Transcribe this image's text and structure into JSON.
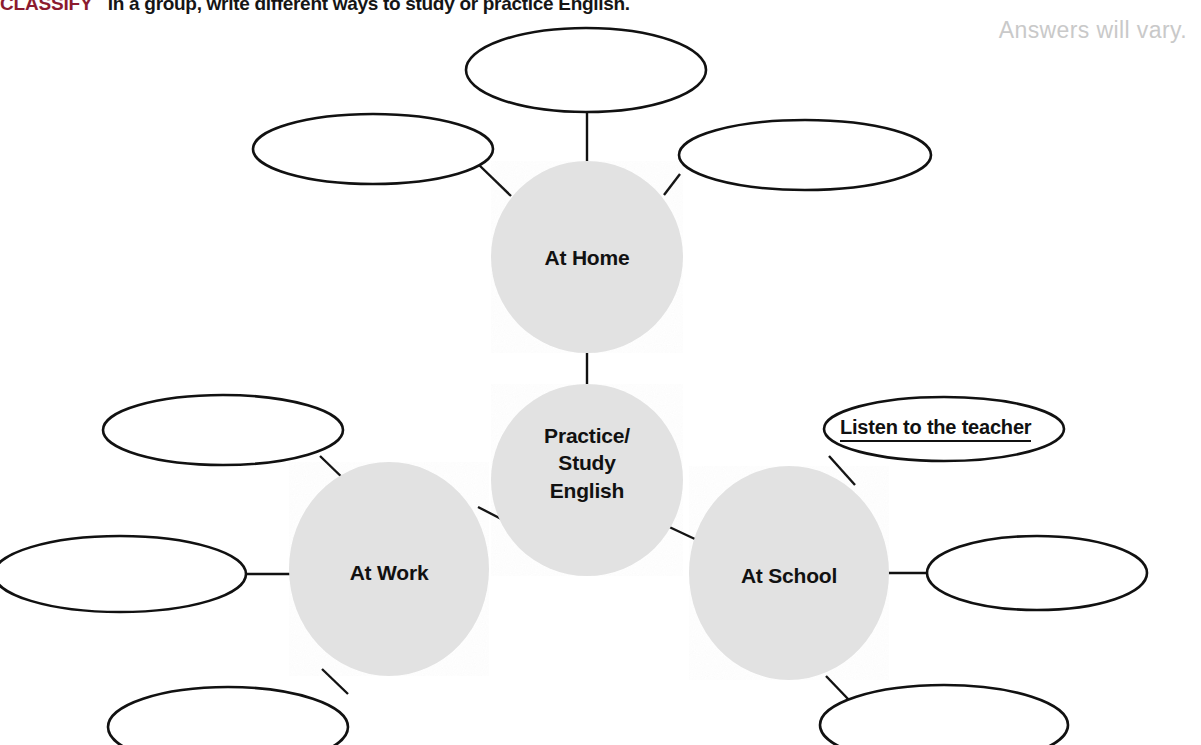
{
  "header": {
    "activity_label": "CLASSIFY",
    "instruction": "In a group, write different ways to study or practice English.",
    "answer_note": "Answers will vary.",
    "label_color": "#8c1b2f"
  },
  "diagram": {
    "type": "cluster-web-organizer",
    "center": {
      "name": "center-node",
      "lines": [
        "Practice/",
        "Study",
        "English"
      ],
      "cx": 587,
      "cy": 480,
      "r": 96,
      "fill": "#e2e2e2"
    },
    "hubs": [
      {
        "name": "hub-at-home",
        "label": "At Home",
        "cx": 587,
        "cy": 257,
        "rx": 96,
        "ry": 96,
        "fill": "#e2e2e2"
      },
      {
        "name": "hub-at-work",
        "label": "At Work",
        "cx": 389,
        "cy": 569,
        "rx": 100,
        "ry": 107,
        "fill": "#e2e2e2"
      },
      {
        "name": "hub-at-school",
        "label": "At School",
        "cx": 789,
        "cy": 573,
        "rx": 100,
        "ry": 107,
        "fill": "#e2e2e2"
      }
    ],
    "bubbles": [
      {
        "name": "bubble-home-top",
        "text": "",
        "cx": 586,
        "cy": 70,
        "rx": 120,
        "ry": 42
      },
      {
        "name": "bubble-home-left",
        "text": "",
        "cx": 373,
        "cy": 149,
        "rx": 120,
        "ry": 35
      },
      {
        "name": "bubble-home-right",
        "text": "",
        "cx": 805,
        "cy": 155,
        "rx": 126,
        "ry": 35
      },
      {
        "name": "bubble-work-top",
        "text": "",
        "cx": 223,
        "cy": 430,
        "rx": 120,
        "ry": 35
      },
      {
        "name": "bubble-work-left",
        "text": "",
        "cx": 120,
        "cy": 574,
        "rx": 126,
        "ry": 38
      },
      {
        "name": "bubble-work-bottom",
        "text": "",
        "cx": 228,
        "cy": 727,
        "rx": 120,
        "ry": 40
      },
      {
        "name": "bubble-school-top",
        "text": "Listen to the teacher",
        "cx": 944,
        "cy": 429,
        "rx": 120,
        "ry": 32
      },
      {
        "name": "bubble-school-right",
        "text": "",
        "cx": 1037,
        "cy": 573,
        "rx": 110,
        "ry": 37
      },
      {
        "name": "bubble-school-bottom",
        "text": "",
        "cx": 944,
        "cy": 725,
        "rx": 124,
        "ry": 40
      }
    ],
    "connectors": [
      {
        "name": "connector-center-to-home",
        "x1": 587,
        "y1": 385,
        "x2": 587,
        "y2": 353
      },
      {
        "name": "connector-center-to-work",
        "x1": 509,
        "y1": 523,
        "x2": 478,
        "y2": 507
      },
      {
        "name": "connector-center-to-school",
        "x1": 665,
        "y1": 525,
        "x2": 697,
        "y2": 540
      },
      {
        "name": "connector-home-top",
        "x1": 587,
        "y1": 112,
        "x2": 587,
        "y2": 161
      },
      {
        "name": "connector-home-left",
        "x1": 478,
        "y1": 164,
        "x2": 511,
        "y2": 196
      },
      {
        "name": "connector-home-right",
        "x1": 680,
        "y1": 174,
        "x2": 664,
        "y2": 195
      },
      {
        "name": "connector-work-top",
        "x1": 320,
        "y1": 456,
        "x2": 350,
        "y2": 485
      },
      {
        "name": "connector-work-left",
        "x1": 246,
        "y1": 574,
        "x2": 294,
        "y2": 574
      },
      {
        "name": "connector-work-bottom",
        "x1": 348,
        "y1": 694,
        "x2": 322,
        "y2": 669
      },
      {
        "name": "connector-school-top",
        "x1": 829,
        "y1": 456,
        "x2": 855,
        "y2": 485
      },
      {
        "name": "connector-school-right",
        "x1": 888,
        "y1": 573,
        "x2": 929,
        "y2": 573
      },
      {
        "name": "connector-school-bottom",
        "x1": 826,
        "y1": 676,
        "x2": 849,
        "y2": 700
      }
    ],
    "stroke_color": "#111111",
    "background": "#ffffff"
  }
}
